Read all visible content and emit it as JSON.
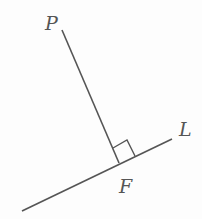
{
  "diagram": {
    "title": "",
    "labels": {
      "point_p": "P",
      "line_l": "L",
      "foot_f": "F"
    },
    "colors": {
      "stroke": "#555555",
      "label": "#555555",
      "background": "#fdfdfd"
    },
    "elements": [
      {
        "type": "segment",
        "name": "PF",
        "from": [
          62,
          30
        ],
        "to": [
          119,
          163
        ]
      },
      {
        "type": "line",
        "name": "L",
        "from": [
          22,
          211
        ],
        "to": [
          172,
          139
        ]
      },
      {
        "type": "right-angle-marker",
        "at": "F"
      }
    ]
  }
}
